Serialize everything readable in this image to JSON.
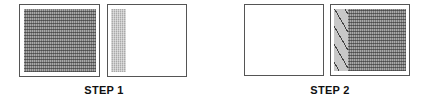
{
  "steps": [
    {
      "label": "STEP 1",
      "panels": [
        {
          "name": "left-panel",
          "content": "dark-dotted-fill"
        },
        {
          "name": "right-panel",
          "content": "light-dotted-strip-left"
        }
      ]
    },
    {
      "label": "STEP 2",
      "panels": [
        {
          "name": "left-panel",
          "content": "empty"
        },
        {
          "name": "right-panel",
          "content": "hatched-strip-left-plus-dark-dotted-fill"
        }
      ]
    }
  ],
  "colors": {
    "border": "#555555",
    "dark_fill": "#7a7a7a",
    "light_fill": "#c4c4c4",
    "hatch_line": "#444444"
  }
}
